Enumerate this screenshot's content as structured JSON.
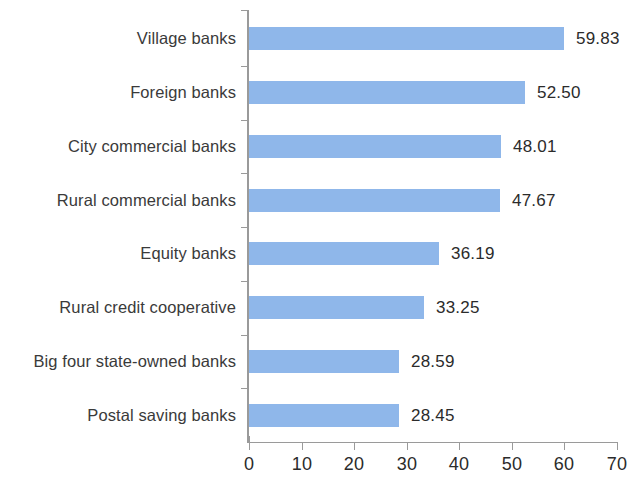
{
  "chart_data": {
    "type": "bar",
    "orientation": "horizontal",
    "title": "",
    "subtitle": "",
    "xlabel": "",
    "ylabel": "",
    "categories": [
      "Village banks",
      "Foreign banks",
      "City commercial banks",
      "Rural commercial banks",
      "Equity banks",
      "Rural credit cooperative",
      "Big four state-owned banks",
      "Postal saving banks"
    ],
    "values": [
      59.83,
      52.5,
      48.01,
      47.67,
      36.19,
      33.25,
      28.59,
      28.45
    ],
    "value_labels": [
      "59.83",
      "52.50",
      "48.01",
      "47.67",
      "36.19",
      "33.25",
      "28.59",
      "28.45"
    ],
    "xlim": [
      0,
      70
    ],
    "xticks": [
      0,
      10,
      20,
      30,
      40,
      50,
      60,
      70
    ],
    "xtick_labels": [
      "0",
      "10",
      "20",
      "30",
      "40",
      "50",
      "60",
      "70"
    ],
    "grid": false,
    "legend": null,
    "bar_color": "#8FB7EA",
    "axis_color": "#9a9a9a",
    "text_color": "#3a3a3a"
  }
}
